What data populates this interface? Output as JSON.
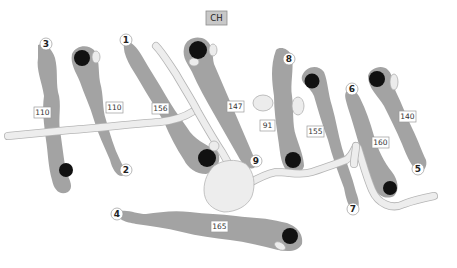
{
  "map": {
    "clubhouse_label": "CH",
    "holes": [
      {
        "number": "1",
        "distance": "156"
      },
      {
        "number": "2",
        "distance": "110"
      },
      {
        "number": "3",
        "distance": "110"
      },
      {
        "number": "4",
        "distance": "165"
      },
      {
        "number": "5",
        "distance": "140"
      },
      {
        "number": "6",
        "distance": "160"
      },
      {
        "number": "7",
        "distance": "155"
      },
      {
        "number": "8",
        "distance": "91"
      },
      {
        "number": "9",
        "distance": "147"
      }
    ],
    "colors": {
      "fairway": "#a3a3a3",
      "green": "#111111",
      "path": "#ededed",
      "clubhouse": "#c8c8c8"
    }
  }
}
